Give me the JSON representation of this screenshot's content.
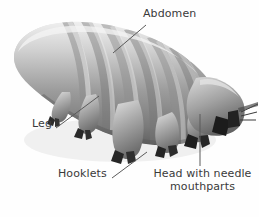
{
  "figure": {
    "background_color": "#fefefe",
    "label_color": "#3a3a3a",
    "body_color": "#9a9a9a",
    "body_highlight_color": "#e2e2e2",
    "body_shadow_color": "#6b6b6b",
    "claw_color": "#2a2a2a"
  },
  "labels": {
    "abdomen": {
      "text": "Abdomen"
    },
    "leg": {
      "text": "Leg"
    },
    "hooklets": {
      "text": "Hooklets"
    },
    "head": {
      "line1": "Head with needle",
      "line2": "mouthparts"
    }
  },
  "leader_lines": [
    {
      "name": "abdomen",
      "x1": 146,
      "y1": 25,
      "x2": 113,
      "y2": 53
    },
    {
      "name": "leg",
      "x1": 56,
      "y1": 128,
      "x2": 99,
      "y2": 96
    },
    {
      "name": "hooklets",
      "x1": 112,
      "y1": 178,
      "x2": 147,
      "y2": 152
    },
    {
      "name": "head",
      "x1": 200,
      "y1": 166,
      "x2": 200,
      "y2": 114
    }
  ]
}
